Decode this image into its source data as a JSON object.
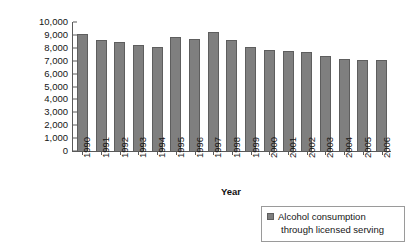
{
  "chart_data": {
    "type": "bar",
    "title": "",
    "xlabel": "Year",
    "ylabel": "Litres of 100% alcohol",
    "ylim": [
      0,
      10000
    ],
    "ytick_labels": [
      "10,000",
      "9,000",
      "8,000",
      "7,000",
      "6,000",
      "5,000",
      "4,000",
      "3,000",
      "2,000",
      "1,000",
      "0"
    ],
    "ytick_values": [
      10000,
      9000,
      8000,
      7000,
      6000,
      5000,
      4000,
      3000,
      2000,
      1000,
      0
    ],
    "grid": false,
    "legend_position": "bottom-right",
    "categories": [
      "1990",
      "1991",
      "1992",
      "1993",
      "1994",
      "1995",
      "1996",
      "1997",
      "1998",
      "1999",
      "2000",
      "2001",
      "2002",
      "2003",
      "2004",
      "2005",
      "2006"
    ],
    "series": [
      {
        "name": "Alcohol consumption through licensed serving",
        "color": "#7f7f7f",
        "values": [
          9100,
          8600,
          8450,
          8200,
          8100,
          8800,
          8650,
          9200,
          8600,
          8100,
          7800,
          7750,
          7650,
          7350,
          7100,
          7050,
          7050
        ]
      }
    ]
  },
  "legend": {
    "line1": "Alcohol consumption",
    "line2": "through licensed serving"
  }
}
